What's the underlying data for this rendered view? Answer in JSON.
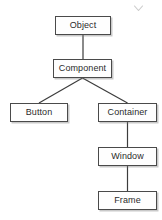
{
  "diagram": {
    "type": "tree",
    "nodes": [
      {
        "id": "object",
        "label": "Object"
      },
      {
        "id": "component",
        "label": "Component"
      },
      {
        "id": "button",
        "label": "Button"
      },
      {
        "id": "container",
        "label": "Container"
      },
      {
        "id": "window",
        "label": "Window"
      },
      {
        "id": "frame",
        "label": "Frame"
      }
    ],
    "edges": [
      {
        "from": "object",
        "to": "component"
      },
      {
        "from": "component",
        "to": "button"
      },
      {
        "from": "component",
        "to": "container"
      },
      {
        "from": "container",
        "to": "window"
      },
      {
        "from": "window",
        "to": "frame"
      }
    ],
    "colors": {
      "background": "#ffffff",
      "box_fill": "#fefefe",
      "box_border": "#4a4a4a",
      "edge_stroke": "#3c3c3c",
      "text": "#2b2b2b",
      "shadow": "#787878"
    },
    "cursor": {
      "icon": "chevron-down-icon",
      "x": 138,
      "y": 8
    }
  }
}
